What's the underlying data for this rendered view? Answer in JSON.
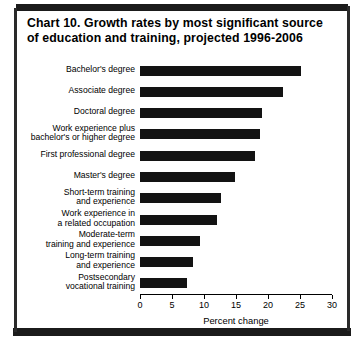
{
  "chart_data": {
    "type": "bar",
    "orientation": "horizontal",
    "title": "Chart 10.  Growth rates by most significant source of education and training, projected 1996-2006",
    "title_line1": "Chart 10.  Growth rates by most significant source",
    "title_line2": "of education and training, projected 1996-2006",
    "xlabel": "Percent change",
    "ylabel": "",
    "xlim": [
      0,
      30
    ],
    "xticks": [
      0,
      5,
      10,
      15,
      20,
      25,
      30
    ],
    "xtick_labels": [
      "0",
      "5",
      "10",
      "15",
      "20",
      "25",
      "30"
    ],
    "grid": false,
    "legend": false,
    "bar_color": "#131313",
    "categories": [
      "Bachelor's degree",
      "Associate degree",
      "Doctoral degree",
      "Work experience plus\nbachelor's or higher degree",
      "First professional degree",
      "Master's degree",
      "Short-term training\nand experience",
      "Work experience in\na related occupation",
      "Moderate-term\ntraining and experience",
      "Long-term training\nand experience",
      "Postsecondary\nvocational training"
    ],
    "values": [
      25.1,
      22.4,
      19.1,
      18.7,
      18.0,
      14.8,
      12.6,
      12.1,
      9.4,
      8.3,
      7.4
    ]
  }
}
